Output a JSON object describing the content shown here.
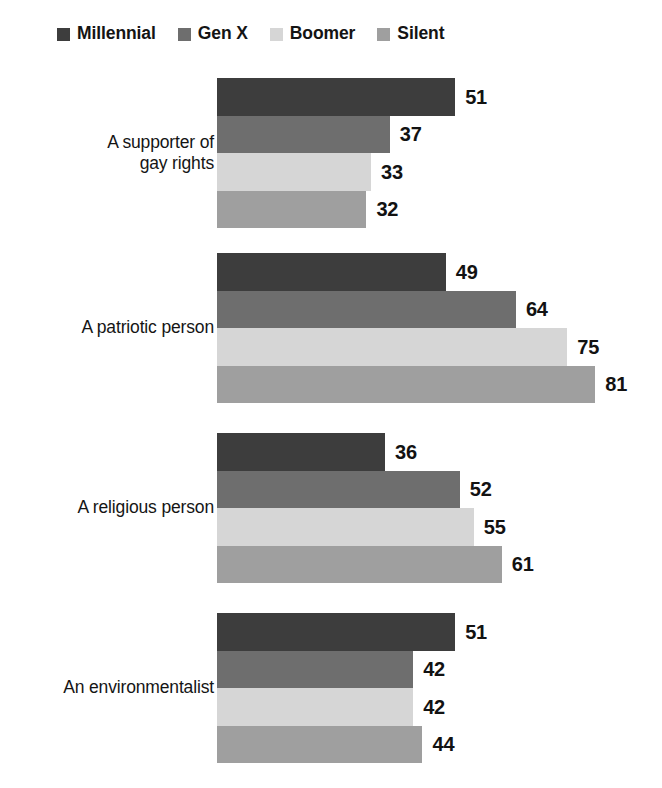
{
  "legend": {
    "position": "top-left",
    "items": [
      {
        "label": "Millennial",
        "color": "#3d3d3d"
      },
      {
        "label": "Gen X",
        "color": "#6e6e6e"
      },
      {
        "label": "Boomer",
        "color": "#d6d6d6"
      },
      {
        "label": "Silent",
        "color": "#9f9f9f"
      }
    ]
  },
  "chart_data": {
    "type": "bar",
    "orientation": "horizontal",
    "title": "",
    "subtitle": "",
    "xlabel": "",
    "ylabel": "",
    "xlim": [
      0,
      100
    ],
    "grid": false,
    "legend_position": "top-left",
    "data_labels": true,
    "categories": [
      "A supporter of\ngay rights",
      "A patriotic person",
      "A religious person",
      "An environmentalist"
    ],
    "series": [
      {
        "name": "Millennial",
        "color": "#3d3d3d",
        "values": [
          51,
          49,
          36,
          51
        ]
      },
      {
        "name": "Gen X",
        "color": "#6e6e6e",
        "values": [
          37,
          64,
          52,
          42
        ]
      },
      {
        "name": "Boomer",
        "color": "#d6d6d6",
        "values": [
          33,
          75,
          55,
          42
        ]
      },
      {
        "name": "Silent",
        "color": "#9f9f9f",
        "values": [
          32,
          81,
          61,
          44
        ]
      }
    ],
    "groups": [
      {
        "category": "A supporter of gay rights",
        "category_line1": "A supporter of",
        "category_line2": "gay rights",
        "bars": [
          {
            "series": "Millennial",
            "value": 51,
            "label": "51",
            "color": "#3d3d3d"
          },
          {
            "series": "Gen X",
            "value": 37,
            "label": "37",
            "color": "#6e6e6e"
          },
          {
            "series": "Boomer",
            "value": 33,
            "label": "33",
            "color": "#d6d6d6"
          },
          {
            "series": "Silent",
            "value": 32,
            "label": "32",
            "color": "#9f9f9f"
          }
        ]
      },
      {
        "category": "A patriotic person",
        "category_line1": "A patriotic person",
        "category_line2": "",
        "bars": [
          {
            "series": "Millennial",
            "value": 49,
            "label": "49",
            "color": "#3d3d3d"
          },
          {
            "series": "Gen X",
            "value": 64,
            "label": "64",
            "color": "#6e6e6e"
          },
          {
            "series": "Boomer",
            "value": 75,
            "label": "75",
            "color": "#d6d6d6"
          },
          {
            "series": "Silent",
            "value": 81,
            "label": "81",
            "color": "#9f9f9f"
          }
        ]
      },
      {
        "category": "A religious person",
        "category_line1": "A religious person",
        "category_line2": "",
        "bars": [
          {
            "series": "Millennial",
            "value": 36,
            "label": "36",
            "color": "#3d3d3d"
          },
          {
            "series": "Gen X",
            "value": 52,
            "label": "52",
            "color": "#6e6e6e"
          },
          {
            "series": "Boomer",
            "value": 55,
            "label": "55",
            "color": "#d6d6d6"
          },
          {
            "series": "Silent",
            "value": 61,
            "label": "61",
            "color": "#9f9f9f"
          }
        ]
      },
      {
        "category": "An environmentalist",
        "category_line1": "An environmentalist",
        "category_line2": "",
        "bars": [
          {
            "series": "Millennial",
            "value": 51,
            "label": "51",
            "color": "#3d3d3d"
          },
          {
            "series": "Gen X",
            "value": 42,
            "label": "42",
            "color": "#6e6e6e"
          },
          {
            "series": "Boomer",
            "value": 42,
            "label": "42",
            "color": "#d6d6d6"
          },
          {
            "series": "Silent",
            "value": 44,
            "label": "44",
            "color": "#9f9f9f"
          }
        ]
      }
    ]
  },
  "geometry": {
    "bar_origin_x": 217,
    "px_per_unit": 4.67,
    "bar_height": 37.5,
    "group_tops": [
      78,
      253,
      433,
      613
    ]
  }
}
